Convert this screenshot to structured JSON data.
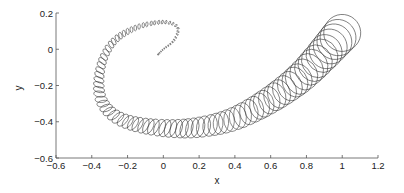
{
  "chart_data": {
    "type": "line",
    "title": "",
    "xlabel": "x",
    "ylabel": "y",
    "xlim": [
      -0.6,
      1.2
    ],
    "ylim": [
      -0.6,
      0.2
    ],
    "xticks": [
      "-0.6",
      "-0.4",
      "-0.2",
      "0",
      "0.2",
      "0.4",
      "0.6",
      "0.8",
      "1",
      "1.2"
    ],
    "yticks": [
      "0.2",
      "0",
      "-0.2",
      "-0.4",
      "-0.6"
    ],
    "grid": false,
    "legend": null,
    "series": [
      {
        "name": "ellipse trajectory",
        "points": [
          {
            "x": -0.03,
            "y": -0.03
          },
          {
            "x": 0.0,
            "y": 0.0
          },
          {
            "x": 0.06,
            "y": 0.05
          },
          {
            "x": 0.08,
            "y": 0.12
          },
          {
            "x": 0.0,
            "y": 0.15
          },
          {
            "x": -0.15,
            "y": 0.12
          },
          {
            "x": -0.28,
            "y": 0.04
          },
          {
            "x": -0.35,
            "y": -0.1
          },
          {
            "x": -0.35,
            "y": -0.27
          },
          {
            "x": -0.25,
            "y": -0.38
          },
          {
            "x": -0.05,
            "y": -0.43
          },
          {
            "x": 0.2,
            "y": -0.43
          },
          {
            "x": 0.45,
            "y": -0.36
          },
          {
            "x": 0.75,
            "y": -0.17
          },
          {
            "x": 1.0,
            "y": 0.09
          }
        ],
        "final_circle_radius": 0.1
      }
    ]
  }
}
